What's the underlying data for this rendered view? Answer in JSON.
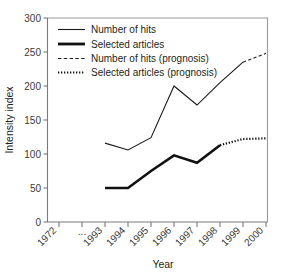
{
  "chart_data": {
    "type": "line",
    "title": "",
    "xlabel": "Year",
    "ylabel": "Intensity index",
    "ylim": [
      0,
      300
    ],
    "ytick_labels": [
      "0",
      "50",
      "100",
      "150",
      "200",
      "250",
      "300"
    ],
    "yticks": [
      0,
      50,
      100,
      150,
      200,
      250,
      300
    ],
    "categories": [
      "1972",
      "...",
      "1993",
      "1994",
      "1995",
      "1996",
      "1997",
      "1998",
      "1999",
      "2000"
    ],
    "xtick_labels": [
      "1972",
      "...",
      "1993",
      "1994",
      "1995",
      "1996",
      "1997",
      "1998",
      "1999",
      "2000"
    ],
    "grid": false,
    "legend_position": "top-left",
    "series": [
      {
        "name": "Number of hits",
        "style": "solid-thin",
        "x": [
          "1993",
          "1994",
          "1995",
          "1996",
          "1997",
          "1998",
          "1999"
        ],
        "values": [
          116,
          106,
          124,
          200,
          172,
          205,
          235
        ]
      },
      {
        "name": "Selected articles",
        "style": "solid-thick",
        "x": [
          "1993",
          "1994",
          "1995",
          "1996",
          "1997",
          "1998"
        ],
        "values": [
          50,
          50,
          75,
          98,
          87,
          113
        ]
      },
      {
        "name": "Number of hits (prognosis)",
        "style": "dashed",
        "x": [
          "1999",
          "2000"
        ],
        "values": [
          235,
          248
        ]
      },
      {
        "name": "Selected articles (prognosis)",
        "style": "dotted",
        "x": [
          "1998",
          "1999",
          "2000"
        ],
        "values": [
          113,
          122,
          123
        ]
      }
    ]
  },
  "legend": {
    "items": [
      {
        "label": "Number of hits",
        "style": "solid-thin"
      },
      {
        "label": "Selected articles",
        "style": "solid-thick"
      },
      {
        "label": "Number of hits (prognosis)",
        "style": "dashed"
      },
      {
        "label": "Selected articles (prognosis)",
        "style": "dotted"
      }
    ]
  },
  "axes": {
    "y_title": "Intensity index",
    "x_title": "Year",
    "y_labels": [
      "300",
      "250",
      "200",
      "150",
      "100",
      "50",
      "0"
    ],
    "x_labels": [
      "1972",
      "...",
      "1993",
      "1994",
      "1995",
      "1996",
      "1997",
      "1998",
      "1999",
      "2000"
    ]
  }
}
